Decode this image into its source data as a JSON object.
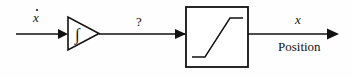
{
  "diagram": {
    "stroke_color": "#111111",
    "background_color": "#fefefe",
    "labels": {
      "input_signal": "x",
      "input_signal_accent": "dot",
      "intermediate_signal": "?",
      "output_signal": "x",
      "output_description": "Position"
    },
    "blocks": [
      {
        "name": "integrator",
        "shape": "triangle",
        "symbol": "∫",
        "x": 67,
        "y": 17,
        "width": 31,
        "height": 33
      },
      {
        "name": "saturation",
        "shape": "rectangle",
        "symbol": "saturation-curve",
        "x": 186,
        "y": 7,
        "width": 62,
        "height": 60
      }
    ],
    "signals": [
      {
        "name": "input-arrow",
        "from_x": 16,
        "to_x": 67,
        "y": 34,
        "arrowhead": true
      },
      {
        "name": "intermediate-arrow",
        "from_x": 98,
        "to_x": 186,
        "y": 34,
        "arrowhead": true
      },
      {
        "name": "output-arrow",
        "from_x": 248,
        "to_x": 338,
        "y": 34,
        "arrowhead": true
      }
    ]
  }
}
